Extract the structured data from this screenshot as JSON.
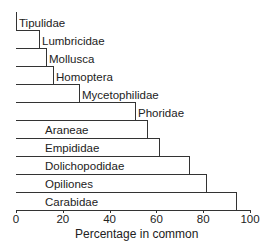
{
  "chart_data": {
    "type": "bar",
    "orientation": "horizontal",
    "title": "",
    "xlabel": "Percentage in common",
    "ylabel": "",
    "xlim": [
      0,
      100
    ],
    "xticks": [
      0,
      20,
      40,
      60,
      80,
      100
    ],
    "grid": false,
    "legend": null,
    "categories": [
      "Tipulidae",
      "Lumbricidae",
      "Mollusca",
      "Homoptera",
      "Mycetophilidae",
      "Phoridae",
      "Araneae",
      "Empididae",
      "Dolichopodidae",
      "Opiliones",
      "Carabidae"
    ],
    "values": [
      0,
      10,
      13,
      16,
      27,
      51,
      56,
      61,
      74,
      81,
      94
    ],
    "label_placement": {
      "outside": [
        "Tipulidae",
        "Lumbricidae",
        "Mollusca",
        "Homoptera",
        "Mycetophilidae",
        "Phoridae"
      ],
      "inside": [
        "Araneae",
        "Empididae",
        "Dolichopodidae",
        "Opiliones",
        "Carabidae"
      ]
    }
  }
}
